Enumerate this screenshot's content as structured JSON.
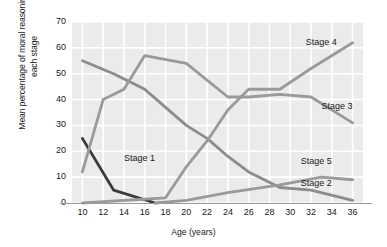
{
  "chart_data": {
    "type": "line",
    "title": "",
    "xlabel": "Age (years)",
    "ylabel": "Mean percentage of moral reasoning at each stage",
    "xlim": [
      9,
      37
    ],
    "ylim": [
      0,
      70
    ],
    "yticks": [
      0,
      10,
      20,
      30,
      40,
      50,
      60,
      70
    ],
    "xticks": [
      10,
      12,
      14,
      16,
      18,
      20,
      22,
      24,
      26,
      28,
      30,
      32,
      34,
      36
    ],
    "grid": true,
    "legend_position": "inline-labels",
    "plot_background": "#ebebeb",
    "series": [
      {
        "name": "Stage 1",
        "color": "#3a3a3a",
        "label_x": 14,
        "label_y": 17,
        "x": [
          10,
          13,
          17
        ],
        "values": [
          25,
          5,
          0
        ]
      },
      {
        "name": "Stage 2",
        "color": "#8c8c8c",
        "label_x": 31,
        "label_y": 7.5,
        "x": [
          10,
          13,
          16,
          18,
          20,
          22,
          24,
          26,
          29,
          32,
          36
        ],
        "values": [
          55,
          50,
          44,
          37,
          30,
          25,
          18,
          12,
          6,
          5,
          1
        ]
      },
      {
        "name": "Stage 3",
        "color": "#9a9a9a",
        "label_x": 33,
        "label_y": 37,
        "x": [
          10,
          12,
          14,
          16,
          20,
          24,
          26,
          29,
          32,
          36
        ],
        "values": [
          12,
          40,
          44,
          57,
          54,
          41,
          41,
          42,
          41,
          31
        ]
      },
      {
        "name": "Stage 4",
        "color": "#9a9a9a",
        "label_x": 31.5,
        "label_y": 62,
        "x": [
          10,
          18,
          20,
          22,
          24,
          26,
          29,
          32,
          36
        ],
        "values": [
          0,
          2,
          14,
          24,
          36,
          44,
          44,
          52,
          62
        ]
      },
      {
        "name": "Stage 5",
        "color": "#9a9a9a",
        "label_x": 31,
        "label_y": 16,
        "x": [
          17,
          20,
          24,
          29,
          33,
          36
        ],
        "values": [
          0,
          1,
          4,
          7,
          10,
          9
        ]
      }
    ]
  }
}
